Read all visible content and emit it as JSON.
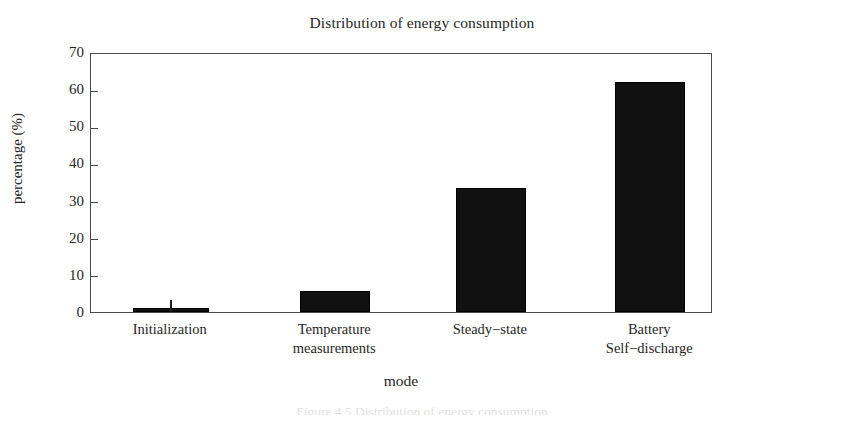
{
  "chart_data": {
    "type": "bar",
    "title": "Distribution of energy consumption",
    "xlabel": "mode",
    "ylabel": "percentage (%)",
    "categories": [
      "Initialization",
      "Temperature measurements",
      "Steady−state",
      "Battery Self−discharge"
    ],
    "category_lines": [
      [
        "Initialization"
      ],
      [
        "Temperature",
        "measurements"
      ],
      [
        "Steady−state"
      ],
      [
        "Battery",
        "Self−discharge"
      ]
    ],
    "values": [
      1.0,
      5.7,
      33.5,
      61.9
    ],
    "ylim": [
      0,
      70
    ],
    "yticks": [
      0,
      10,
      20,
      30,
      40,
      50,
      60,
      70
    ],
    "ytick_labels": [
      "0",
      "10",
      "20",
      "30",
      "40",
      "50",
      "60",
      "70"
    ],
    "grid": false,
    "legend": "none",
    "bar_color": "#111111",
    "frame_color": "#4a4a4a",
    "bar_annotations": [
      {
        "index": 0,
        "type": "spike",
        "top_value": 3.2
      }
    ]
  },
  "caption": {
    "text": "Figure 4.5 Distribution of energy consumption"
  }
}
